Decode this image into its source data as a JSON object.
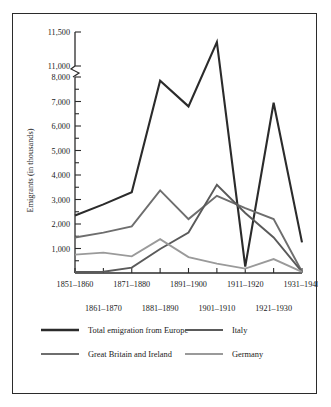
{
  "chart_data": {
    "type": "line",
    "title": "",
    "xlabel": "",
    "ylabel": "Emigrants (in thousands)",
    "grid": false,
    "legend_position": "bottom",
    "axis_break": {
      "present": true,
      "between": [
        8000,
        11000
      ],
      "note": "broken y-axis between 8,000 and 11,000"
    },
    "ylim": [
      0,
      11500
    ],
    "y_ticks_labeled": [
      1000,
      2000,
      3000,
      4000,
      5000,
      6000,
      7000,
      8000,
      11000,
      11500
    ],
    "y_tick_labels": [
      "1,000",
      "2,000",
      "3,000",
      "4,000",
      "5,000",
      "6,000",
      "7,000",
      "8,000",
      "11,000",
      "11,500"
    ],
    "categories": [
      "1851–1860",
      "1861–1870",
      "1871–1880",
      "1881–1890",
      "1891–1900",
      "1901–1910",
      "1911–1920",
      "1921–1930",
      "1931–1940"
    ],
    "x_ticks_row_top": [
      "1851–1860",
      "1871–1880",
      "1891–1900",
      "1911–1920",
      "1931–1940"
    ],
    "x_ticks_row_bottom": [
      "1861–1870",
      "1881–1890",
      "1901–1910",
      "1921–1930"
    ],
    "series": [
      {
        "name": "Total emigration from Europe",
        "color": "#2b2b2b",
        "width": 2.1,
        "values": [
          2350,
          2800,
          3300,
          7850,
          6800,
          11350,
          8050,
          6950,
          1250
        ]
      },
      {
        "name": "Great Britain and Ireland",
        "color": "#6e6e6e",
        "width": 1.9,
        "values": [
          1450,
          1650,
          1900,
          3370,
          2200,
          3150,
          2650,
          2200,
          50
        ]
      },
      {
        "name": "Italy",
        "color": "#5a5a5a",
        "width": 1.9,
        "values": [
          40,
          50,
          220,
          980,
          1650,
          3600,
          2450,
          1450,
          50
        ]
      },
      {
        "name": "Germany",
        "color": "#9a9a9a",
        "width": 1.9,
        "values": [
          750,
          830,
          680,
          1380,
          650,
          380,
          180,
          570,
          50
        ]
      }
    ]
  },
  "legend": {
    "entries": [
      {
        "label": "Total emigration from Europe",
        "color": "#2b2b2b",
        "column": 1,
        "row": 1
      },
      {
        "label": "Italy",
        "color": "#5a5a5a",
        "column": 2,
        "row": 1
      },
      {
        "label": "Great Britain and Ireland",
        "color": "#6e6e6e",
        "column": 1,
        "row": 2
      },
      {
        "label": "Germany",
        "color": "#9a9a9a",
        "column": 2,
        "row": 2
      }
    ]
  }
}
